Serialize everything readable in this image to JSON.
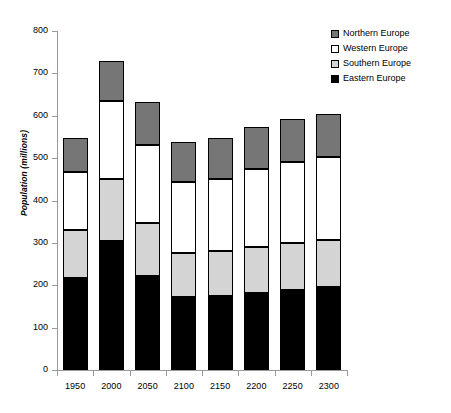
{
  "chart_data": {
    "type": "bar",
    "stacked": true,
    "title": "",
    "xlabel": "",
    "ylabel": "Population (millions)",
    "categories": [
      "1950",
      "2000",
      "2050",
      "2100",
      "2150",
      "2200",
      "2250",
      "2300"
    ],
    "ylim": [
      0,
      800
    ],
    "yticks": [
      0,
      100,
      200,
      300,
      400,
      500,
      600,
      700,
      800
    ],
    "ytick_labels": [
      "0",
      "100",
      "200",
      "300",
      "400",
      "500",
      "600",
      "700",
      "800"
    ],
    "grid": false,
    "legend_position": "top-right",
    "series": [
      {
        "name": "Eastern Europe",
        "color": "#000000",
        "values": [
          218,
          305,
          222,
          172,
          175,
          182,
          190,
          195
        ]
      },
      {
        "name": "Southern Europe",
        "color": "#d4d4d4",
        "values": [
          112,
          145,
          125,
          104,
          105,
          108,
          110,
          111
        ]
      },
      {
        "name": "Western Europe",
        "color": "#ffffff",
        "values": [
          137,
          185,
          183,
          167,
          170,
          185,
          190,
          197
        ]
      },
      {
        "name": "Northern Europe",
        "color": "#767676",
        "values": [
          80,
          95,
          102,
          95,
          98,
          98,
          102,
          100
        ]
      }
    ],
    "totals": [
      547,
      730,
      632,
      538,
      548,
      573,
      592,
      603
    ]
  },
  "legend": {
    "items": [
      {
        "label": "Northern Europe",
        "color": "#767676"
      },
      {
        "label": "Western Europe",
        "color": "#ffffff"
      },
      {
        "label": "Southern Europe",
        "color": "#d4d4d4"
      },
      {
        "label": "Eastern Europe",
        "color": "#000000"
      }
    ]
  },
  "axis_colors": {
    "axis_line": "#9a9a9a",
    "bar_outline": "#000000"
  }
}
